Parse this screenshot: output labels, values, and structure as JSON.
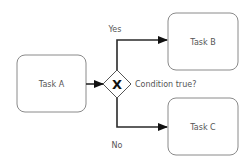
{
  "diagram": {
    "type": "bpmn-flow",
    "tasks": [
      {
        "id": "task-a",
        "label": "Task A"
      },
      {
        "id": "task-b",
        "label": "Task B"
      },
      {
        "id": "task-c",
        "label": "Task C"
      }
    ],
    "gateway": {
      "type": "exclusive",
      "symbol": "X",
      "label": "Condition true?"
    },
    "flows": [
      {
        "from": "task-a",
        "to": "gateway",
        "label": ""
      },
      {
        "from": "gateway",
        "to": "task-b",
        "label": "Yes"
      },
      {
        "from": "gateway",
        "to": "task-c",
        "label": "No"
      }
    ]
  }
}
